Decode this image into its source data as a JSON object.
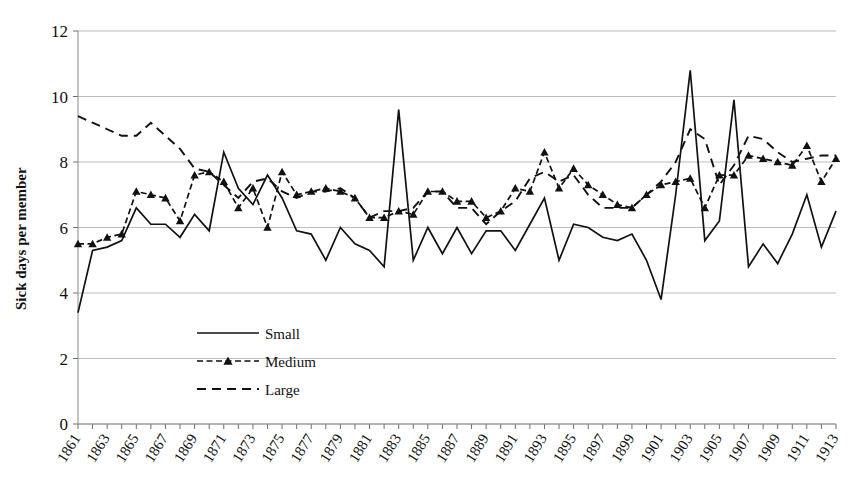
{
  "figure": {
    "partial_caption": "",
    "ylabel": "Sick days per member",
    "xlabel": ""
  },
  "legend": {
    "position": "inside-lower-left",
    "items": [
      {
        "label": "Small",
        "style": "solid"
      },
      {
        "label": "Medium",
        "style": "dashed-with-triangle-markers"
      },
      {
        "label": "Large",
        "style": "dashed"
      }
    ]
  },
  "axes": {
    "y_ticks": [
      "0",
      "2",
      "4",
      "6",
      "8",
      "10",
      "12"
    ],
    "x_ticks": [
      "1861",
      "1863",
      "1865",
      "1867",
      "1869",
      "1871",
      "1873",
      "1875",
      "1877",
      "1879",
      "1881",
      "1883",
      "1885",
      "1887",
      "1889",
      "1891",
      "1893",
      "1895",
      "1897",
      "1899",
      "1901",
      "1903",
      "1905",
      "1907",
      "1909",
      "1911",
      "1913"
    ]
  },
  "colors": {
    "line": "#111111",
    "grid": "#b4b4b4",
    "axis": "#8a8a8a",
    "background": "#ffffff"
  },
  "chart_data": {
    "type": "line",
    "title": "",
    "xlabel": "",
    "ylabel": "Sick days per member",
    "ylim": [
      0,
      12
    ],
    "xlim": [
      1861,
      1913
    ],
    "grid": true,
    "legend_position": "inside-lower-left",
    "x": [
      1861,
      1862,
      1863,
      1864,
      1865,
      1866,
      1867,
      1868,
      1869,
      1870,
      1871,
      1872,
      1873,
      1874,
      1875,
      1876,
      1877,
      1878,
      1879,
      1880,
      1881,
      1882,
      1883,
      1884,
      1885,
      1886,
      1887,
      1888,
      1889,
      1890,
      1891,
      1892,
      1893,
      1894,
      1895,
      1896,
      1897,
      1898,
      1899,
      1900,
      1901,
      1902,
      1903,
      1904,
      1905,
      1906,
      1907,
      1908,
      1909,
      1910,
      1911,
      1912,
      1913
    ],
    "series": [
      {
        "name": "Small",
        "style": "solid",
        "values": [
          3.4,
          5.3,
          5.4,
          5.6,
          6.6,
          6.1,
          6.1,
          5.7,
          6.4,
          5.9,
          8.3,
          7.2,
          6.7,
          7.6,
          6.9,
          5.9,
          5.8,
          5.0,
          6.0,
          5.5,
          5.3,
          4.8,
          9.6,
          5.0,
          6.0,
          5.2,
          6.0,
          5.2,
          5.9,
          5.9,
          5.3,
          6.1,
          6.9,
          5.0,
          6.1,
          6.0,
          5.7,
          5.6,
          5.8,
          5.0,
          3.8,
          7.0,
          10.8,
          5.6,
          6.2,
          9.9,
          4.8,
          5.5,
          4.9,
          5.8,
          7.0,
          5.4,
          6.5
        ]
      },
      {
        "name": "Medium",
        "style": "dashed-with-triangle-markers",
        "values": [
          5.5,
          5.5,
          5.7,
          5.8,
          7.1,
          7.0,
          6.9,
          6.2,
          7.6,
          7.7,
          7.4,
          6.6,
          7.2,
          6.0,
          7.7,
          7.0,
          7.1,
          7.2,
          7.1,
          6.9,
          6.3,
          6.3,
          6.5,
          6.4,
          7.1,
          7.1,
          6.8,
          6.8,
          6.3,
          6.5,
          7.2,
          7.1,
          8.3,
          7.2,
          7.8,
          7.3,
          7.0,
          6.7,
          6.6,
          7.0,
          7.3,
          7.4,
          7.5,
          6.6,
          7.6,
          7.6,
          8.2,
          8.1,
          8.0,
          7.9,
          8.5,
          7.4,
          8.1
        ]
      },
      {
        "name": "Large",
        "style": "dashed",
        "values": [
          9.4,
          9.2,
          9.0,
          8.8,
          8.8,
          9.2,
          8.8,
          8.4,
          7.8,
          7.7,
          7.3,
          6.9,
          7.4,
          7.5,
          7.1,
          6.9,
          7.1,
          7.1,
          7.2,
          6.9,
          6.3,
          6.5,
          6.5,
          6.6,
          7.1,
          7.1,
          6.6,
          6.6,
          6.1,
          6.5,
          6.8,
          7.5,
          7.7,
          7.4,
          7.6,
          7.0,
          6.6,
          6.6,
          6.6,
          7.0,
          7.4,
          8.0,
          9.0,
          8.7,
          7.3,
          7.9,
          8.8,
          8.7,
          8.3,
          8.0,
          8.1,
          8.2,
          8.2
        ]
      }
    ]
  }
}
